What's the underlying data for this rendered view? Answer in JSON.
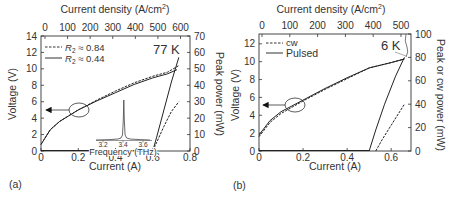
{
  "panels": {
    "a": {
      "label": "(a)",
      "temperature": "77 K",
      "top_axis_title": "Current density (A/cm",
      "top_axis_sup": "2",
      "top_axis_close": ")",
      "top_ticks": [
        "0",
        "100",
        "200",
        "300",
        "400",
        "500",
        "600"
      ],
      "left_axis_title": "Voltage (V)",
      "left_ticks": [
        "0",
        "2",
        "4",
        "6",
        "8",
        "10",
        "12",
        "14"
      ],
      "right_axis_title": "Peak power (mW)",
      "right_ticks": [
        "0",
        "10",
        "20",
        "30",
        "40",
        "50",
        "60",
        "70"
      ],
      "bottom_axis_title": "Current (A)",
      "bottom_ticks": [
        "0",
        "0.2",
        "0.4",
        "0.6",
        "0.8"
      ],
      "legend": [
        {
          "style": "dashed",
          "label_prefix": "R",
          "label_sub": "2",
          "label_suffix": " ≈ 0.84"
        },
        {
          "style": "solid",
          "label_prefix": "R",
          "label_sub": "2",
          "label_suffix": " ≈ 0.44"
        }
      ],
      "inset": {
        "xlabel": "Frequency (THz)",
        "ticks": [
          "3.2",
          "3.4",
          "3.6"
        ]
      }
    },
    "b": {
      "label": "(b)",
      "temperature": "6 K",
      "top_axis_title": "Current density (A/cm",
      "top_axis_sup": "2",
      "top_axis_close": ")",
      "top_ticks": [
        "0",
        "100",
        "200",
        "300",
        "400",
        "500"
      ],
      "left_axis_title": "Voltage (V)",
      "left_ticks": [
        "0",
        "2",
        "4",
        "6",
        "8",
        "10",
        "12"
      ],
      "right_axis_title": "Peak or cw power (mW)",
      "right_ticks": [
        "0",
        "20",
        "40",
        "60",
        "80",
        "100"
      ],
      "bottom_axis_title": "Current (A)",
      "bottom_ticks": [
        "0",
        "0.2",
        "0.4",
        "0.6"
      ],
      "legend": [
        {
          "style": "dashed",
          "label": "cw"
        },
        {
          "style": "solid",
          "label": "Pulsed"
        }
      ]
    }
  },
  "chart_data": [
    {
      "type": "line",
      "title": "(a) 77 K",
      "xlabel": "Current (A)",
      "ylabel": "Voltage (V)",
      "y2label": "Peak power (mW)",
      "x2label": "Current density (A/cm2)",
      "xlim": [
        0,
        0.8
      ],
      "ylim": [
        0,
        14
      ],
      "y2lim": [
        0,
        70
      ],
      "x2lim": [
        0,
        620
      ],
      "grid": false,
      "legend_position": "upper left",
      "series": [
        {
          "name": "R2 ≈ 0.84 (voltage)",
          "axis": "left",
          "style": "dashed",
          "x": [
            0,
            0.05,
            0.1,
            0.2,
            0.3,
            0.4,
            0.5,
            0.6,
            0.68,
            0.74
          ],
          "y": [
            0.8,
            2.6,
            3.6,
            5.0,
            6.2,
            7.3,
            8.3,
            9.1,
            9.6,
            10.4
          ]
        },
        {
          "name": "R2 ≈ 0.44 (voltage)",
          "axis": "left",
          "style": "solid",
          "x": [
            0,
            0.05,
            0.1,
            0.2,
            0.3,
            0.4,
            0.5,
            0.6,
            0.68,
            0.73
          ],
          "y": [
            0.8,
            2.6,
            3.6,
            5.0,
            6.1,
            7.1,
            8.1,
            8.9,
            9.4,
            9.9
          ]
        },
        {
          "name": "R2 ≈ 0.84 (power)",
          "axis": "right",
          "style": "dashed",
          "x": [
            0.6,
            0.62,
            0.66,
            0.7,
            0.74
          ],
          "y": [
            0,
            5,
            15,
            24,
            30
          ]
        },
        {
          "name": "R2 ≈ 0.44 (power)",
          "axis": "right",
          "style": "solid",
          "x": [
            0.6,
            0.62,
            0.66,
            0.7,
            0.74
          ],
          "y": [
            0,
            8,
            25,
            42,
            57
          ]
        }
      ],
      "inset": {
        "type": "spectrum",
        "xlabel": "Frequency (THz)",
        "xticks": [
          3.2,
          3.4,
          3.6
        ],
        "peak_at": 3.42
      },
      "annotations": [
        "77 K",
        "arrow pointing to left axis from circled voltage curves"
      ]
    },
    {
      "type": "line",
      "title": "(b) 6 K",
      "xlabel": "Current (A)",
      "ylabel": "Voltage (V)",
      "y2label": "Peak or cw power (mW)",
      "x2label": "Current density (A/cm2)",
      "xlim": [
        0,
        0.69
      ],
      "ylim": [
        0,
        13.1
      ],
      "y2lim": [
        0,
        100
      ],
      "x2lim": [
        0,
        530
      ],
      "grid": false,
      "legend_position": "upper left",
      "series": [
        {
          "name": "cw (voltage)",
          "axis": "left",
          "style": "dashed",
          "x": [
            0,
            0.05,
            0.1,
            0.2,
            0.3,
            0.4,
            0.5,
            0.6,
            0.66
          ],
          "y": [
            1.6,
            3.2,
            4.2,
            5.6,
            6.9,
            8.1,
            9.3,
            9.9,
            10.3
          ]
        },
        {
          "name": "Pulsed (voltage)",
          "axis": "left",
          "style": "solid",
          "x": [
            0,
            0.05,
            0.1,
            0.2,
            0.3,
            0.4,
            0.5,
            0.6,
            0.66
          ],
          "y": [
            1.8,
            3.4,
            4.4,
            5.7,
            7.0,
            8.2,
            9.3,
            9.9,
            10.3
          ]
        },
        {
          "name": "cw (power)",
          "axis": "right",
          "style": "dashed",
          "x": [
            0.53,
            0.56,
            0.6,
            0.64,
            0.66
          ],
          "y": [
            0,
            10,
            22,
            34,
            40
          ]
        },
        {
          "name": "Pulsed (power)",
          "axis": "right",
          "style": "solid",
          "x": [
            0.5,
            0.53,
            0.57,
            0.62,
            0.66
          ],
          "y": [
            0,
            18,
            40,
            64,
            80
          ]
        }
      ],
      "annotations": [
        "6 K",
        "arrow pointing to left axis from circled voltage curves"
      ]
    }
  ]
}
